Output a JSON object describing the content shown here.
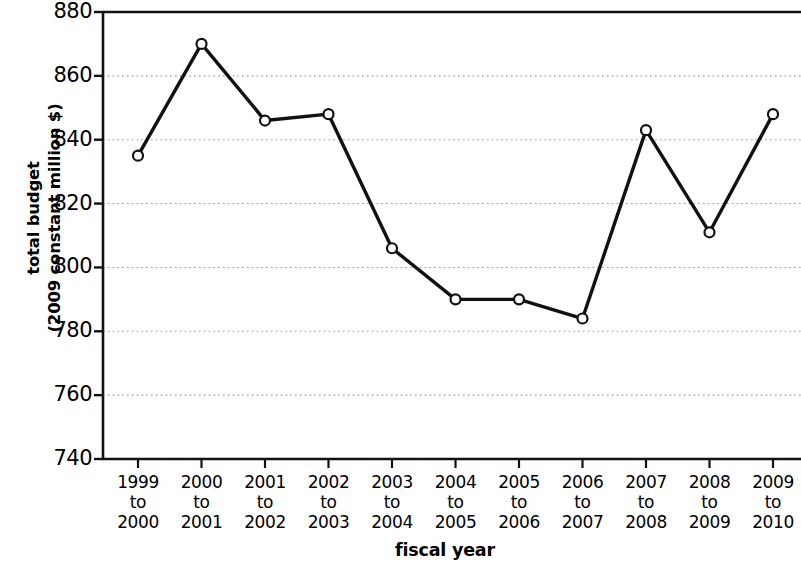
{
  "chart_data": {
    "type": "line",
    "title": "",
    "xlabel": "fiscal year",
    "ylabel": "total budget\n(2009 constant million $)",
    "ylabel_lines": [
      "total budget",
      "(2009 constant million $)"
    ],
    "categories": [
      "1999 to 2000",
      "2000 to 2001",
      "2001 to 2002",
      "2002 to 2003",
      "2003 to 2004",
      "2004 to 2005",
      "2005 to 2006",
      "2006 to 2007",
      "2007 to 2008",
      "2008 to 2009",
      "2009 to 2010"
    ],
    "category_lines": [
      [
        "1999",
        "to",
        "2000"
      ],
      [
        "2000",
        "to",
        "2001"
      ],
      [
        "2001",
        "to",
        "2002"
      ],
      [
        "2002",
        "to",
        "2003"
      ],
      [
        "2003",
        "to",
        "2004"
      ],
      [
        "2004",
        "to",
        "2005"
      ],
      [
        "2005",
        "to",
        "2006"
      ],
      [
        "2006",
        "to",
        "2007"
      ],
      [
        "2007",
        "to",
        "2008"
      ],
      [
        "2008",
        "to",
        "2009"
      ],
      [
        "2009",
        "to",
        "2010"
      ]
    ],
    "values": [
      835,
      870,
      846,
      848,
      806,
      790,
      790,
      784,
      843,
      811,
      848
    ],
    "ylim": [
      740,
      880
    ],
    "yticks": [
      740,
      760,
      780,
      800,
      820,
      840,
      860,
      880
    ],
    "ytick_labels": [
      "740",
      "760",
      "780",
      "800",
      "820",
      "840",
      "860",
      "880"
    ],
    "grid": true,
    "grid_style": "dotted",
    "legend": null,
    "series": [
      {
        "name": "total budget",
        "values": [
          835,
          870,
          846,
          848,
          806,
          790,
          790,
          784,
          843,
          811,
          848
        ]
      }
    ],
    "colors": {
      "line": "#111111",
      "marker_fill": "#ffffff",
      "marker_stroke": "#111111",
      "grid": "#9a9a9a",
      "axis": "#111111",
      "background": "#ffffff"
    }
  }
}
